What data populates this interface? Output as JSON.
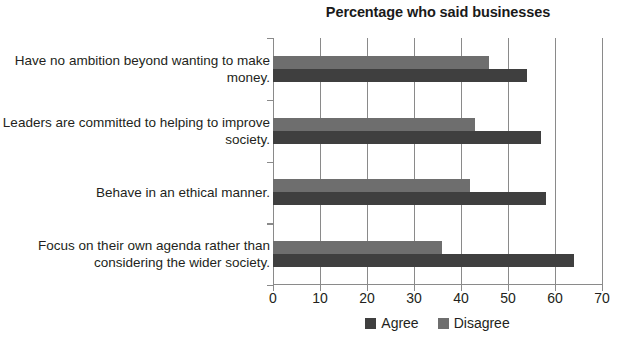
{
  "chart_data": {
    "type": "bar",
    "orientation": "horizontal",
    "title": "Percentage who said businesses",
    "xlabel": "",
    "ylabel": "",
    "xlim": [
      0,
      70
    ],
    "xticks": [
      0,
      10,
      20,
      30,
      40,
      50,
      60,
      70
    ],
    "xtick_labels": [
      "0",
      "10",
      "20",
      "30",
      "40",
      "50",
      "60",
      "70"
    ],
    "grid": true,
    "grid_axis": "x",
    "legend_position": "bottom-center",
    "categories": [
      "Have no ambition beyond wanting to make money.",
      "Leaders are committed to helping to improve society.",
      "Behave in an ethical manner.",
      "Focus on their own agenda rather than considering the wider society."
    ],
    "series": [
      {
        "name": "Agree",
        "color": "#3f3f3f",
        "values": [
          54,
          57,
          58,
          64
        ]
      },
      {
        "name": "Disagree",
        "color": "#6e6e6e",
        "values": [
          46,
          43,
          42,
          36
        ]
      }
    ]
  },
  "legend": {
    "items": [
      {
        "label": "Agree",
        "color": "#3f3f3f"
      },
      {
        "label": "Disagree",
        "color": "#6e6e6e"
      }
    ]
  },
  "axis": {
    "line_color": "#8a8a8a"
  }
}
